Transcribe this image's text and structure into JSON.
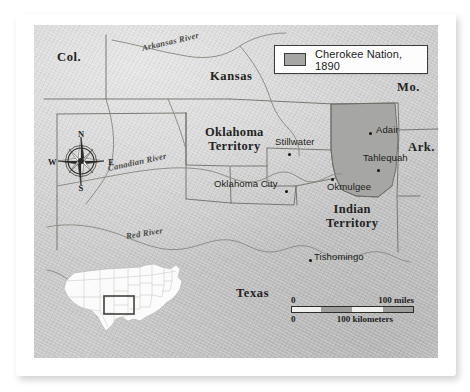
{
  "map": {
    "legend": {
      "label": "Cherokee Nation, 1890",
      "swatch_color": "#a6a6a4",
      "swatch_name": "cherokee-nation-swatch"
    },
    "state_labels": [
      {
        "name": "colorado",
        "text": "Col.",
        "x": 57,
        "y": 57
      },
      {
        "name": "kansas",
        "text": "Kansas",
        "x": 210,
        "y": 76
      },
      {
        "name": "missouri",
        "text": "Mo.",
        "x": 400,
        "y": 87
      },
      {
        "name": "arkansas",
        "text": "Ark.",
        "x": 412,
        "y": 147
      },
      {
        "name": "texas",
        "text": "Texas",
        "x": 238,
        "y": 293
      }
    ],
    "territory_labels": [
      {
        "name": "oklahoma-territory",
        "line1": "Oklahoma",
        "line2": "Territory",
        "x": 205,
        "y": 133
      },
      {
        "name": "indian-territory",
        "line1": "Indian",
        "line2": "Territory",
        "x": 328,
        "y": 209
      }
    ],
    "cities": [
      {
        "name": "stillwater",
        "text": "Stillwater",
        "lx": 275,
        "ly": 142,
        "dx": 288,
        "dy": 154
      },
      {
        "name": "oklahoma-city",
        "text": "Oklahoma City",
        "lx": 214,
        "ly": 184,
        "dx": 284,
        "dy": 191
      },
      {
        "name": "okmulgee",
        "text": "Okmulgee",
        "lx": 327,
        "ly": 187,
        "dx": 330,
        "dy": 181
      },
      {
        "name": "adair",
        "text": "Adair",
        "lx": 376,
        "ly": 130,
        "dx": 369,
        "dy": 134
      },
      {
        "name": "tahlequah",
        "text": "Tahlequah",
        "lx": 363,
        "ly": 158,
        "dx": 375,
        "dy": 170
      },
      {
        "name": "tishomingo",
        "text": "Tishomingo",
        "lx": 314,
        "ly": 257,
        "dx": 310,
        "dy": 260
      }
    ],
    "rivers": [
      {
        "name": "arkansas-river",
        "text": "Arkansas River",
        "x": 142,
        "y": 48,
        "rot": -13
      },
      {
        "name": "canadian-river",
        "text": "Canadian River",
        "x": 108,
        "y": 167,
        "rot": -12
      },
      {
        "name": "red-river",
        "text": "Red River",
        "x": 126,
        "y": 235,
        "rot": -9
      }
    ],
    "compass": {
      "north": "N",
      "south": "S",
      "west": "W",
      "east": "E"
    },
    "scale": {
      "miles_zero": "0",
      "miles_value": "100 miles",
      "km_zero": "0",
      "km_value": "100 kilometers"
    },
    "inset": {
      "name": "united-states-inset",
      "highlight_name": "oklahoma-highlight-box"
    },
    "colors": {
      "paper": "#ffffff",
      "map_fill": "#c9c9c9",
      "cherokee_fill": "#a6a6a4",
      "border_line": "#6e6e68",
      "river_line": "#8a8a84",
      "text": "#23231f"
    }
  }
}
